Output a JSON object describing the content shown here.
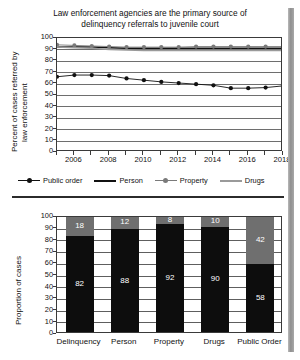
{
  "chart_data": [
    {
      "type": "line",
      "title": "Law enforcement agencies are the primary source of delinquency referrals to juvenile court",
      "title_line1": "Law enforcement agencies are the primary source of",
      "title_line2": "delinquency referrals to juvenile court",
      "xlabel": "",
      "ylabel": "Percent of cases referred by law enforcement",
      "ylabel_line1": "Percent of cases referred by",
      "ylabel_line2": "law enforcement",
      "ylim": [
        0,
        100
      ],
      "ytick_labels": [
        "0",
        "10",
        "20",
        "30",
        "40",
        "50",
        "60",
        "70",
        "80",
        "90",
        "100"
      ],
      "ytick_values": [
        0,
        10,
        20,
        30,
        40,
        50,
        60,
        70,
        80,
        90,
        100
      ],
      "xlim": [
        2005,
        2018
      ],
      "x": [
        2005,
        2006,
        2007,
        2008,
        2009,
        2010,
        2011,
        2012,
        2013,
        2014,
        2015,
        2016,
        2017,
        2018
      ],
      "xtick_labels": [
        "2006",
        "2008",
        "2010",
        "2012",
        "2014",
        "2016",
        "2018"
      ],
      "xtick_values": [
        2006,
        2008,
        2010,
        2012,
        2014,
        2016,
        2018
      ],
      "grid": true,
      "legend_position": "below",
      "series": [
        {
          "name": "Public order",
          "marker": "circle",
          "color": "#111111",
          "values": [
            66,
            67.5,
            67.5,
            67,
            64.5,
            63,
            61.5,
            60.5,
            59.5,
            58.5,
            56,
            56,
            56.5,
            58
          ]
        },
        {
          "name": "Person",
          "marker": "none",
          "color": "#111111",
          "values": [
            92,
            92,
            92,
            91.5,
            91,
            91,
            91,
            91,
            91,
            91,
            91,
            91,
            91,
            91
          ]
        },
        {
          "name": "Property",
          "marker": "circle",
          "color": "#7a7a7a",
          "values": [
            94,
            93.5,
            93,
            92.5,
            92,
            92,
            92,
            92,
            92.5,
            92.5,
            92.5,
            92.5,
            92.5,
            92.5
          ]
        },
        {
          "name": "Drugs",
          "marker": "none",
          "color": "#9a9a9a",
          "values": [
            92,
            91.5,
            91,
            90,
            89.5,
            89,
            89,
            89,
            89,
            89,
            89,
            89,
            89,
            89
          ]
        }
      ]
    },
    {
      "type": "bar",
      "title": "",
      "xlabel": "",
      "ylabel": "Proportion of cases",
      "ylim": [
        0,
        100
      ],
      "ytick_labels": [
        "0",
        "10",
        "20",
        "30",
        "40",
        "50",
        "60",
        "70",
        "80",
        "90",
        "100"
      ],
      "ytick_values": [
        0,
        10,
        20,
        30,
        40,
        50,
        60,
        70,
        80,
        90,
        100
      ],
      "grid": true,
      "stacked": true,
      "categories": [
        "Delinquency",
        "Person",
        "Property",
        "Drugs",
        "Public Order"
      ],
      "series": [
        {
          "name": "law-enforcement",
          "color": "#0d0d0d",
          "values": [
            82,
            88,
            92,
            90,
            58
          ]
        },
        {
          "name": "other-source",
          "color": "#6f6f6f",
          "values": [
            18,
            12,
            8,
            10,
            42
          ]
        }
      ]
    }
  ],
  "line_chart": {
    "title_line1": "Law enforcement agencies are the primary source of",
    "title_line2": "delinquency referrals to juvenile court",
    "ylabel_line1": "Percent of cases referred by",
    "ylabel_line2": "law enforcement",
    "yticks": [
      "100",
      "90",
      "80",
      "70",
      "60",
      "50",
      "40",
      "30",
      "20",
      "10",
      "0"
    ],
    "xticks": [
      "2006",
      "2008",
      "2010",
      "2012",
      "2014",
      "2016",
      "2018"
    ],
    "legend": [
      {
        "label": "Public order",
        "color": "#111111",
        "marker": true
      },
      {
        "label": "Person",
        "color": "#111111",
        "marker": false
      },
      {
        "label": "Property",
        "color": "#7a7a7a",
        "marker": true
      },
      {
        "label": "Drugs",
        "color": "#9a9a9a",
        "marker": false
      }
    ]
  },
  "bar_chart": {
    "ylabel": "Proportion of cases",
    "yticks": [
      "100",
      "90",
      "80",
      "70",
      "60",
      "50",
      "40",
      "30",
      "20",
      "10",
      "0"
    ],
    "bars": [
      {
        "category": "Delinquency",
        "bottom": 82,
        "top": 18,
        "bottom_label": "82",
        "top_label": "18"
      },
      {
        "category": "Person",
        "bottom": 88,
        "top": 12,
        "bottom_label": "88",
        "top_label": "12"
      },
      {
        "category": "Property",
        "bottom": 92,
        "top": 8,
        "bottom_label": "92",
        "top_label": "8"
      },
      {
        "category": "Drugs",
        "bottom": 90,
        "top": 10,
        "bottom_label": "90",
        "top_label": "10"
      },
      {
        "category": "Public Order",
        "bottom": 58,
        "top": 42,
        "bottom_label": "58",
        "top_label": "42"
      }
    ]
  }
}
